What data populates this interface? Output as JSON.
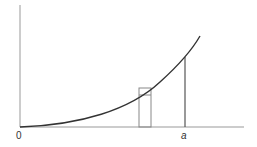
{
  "diagram": {
    "type": "area-under-curve",
    "labels": {
      "origin": "0",
      "a": "a"
    },
    "colors": {
      "curve": "#333333",
      "axes": "#888888",
      "strip": "#777777",
      "vline": "#555555"
    }
  }
}
